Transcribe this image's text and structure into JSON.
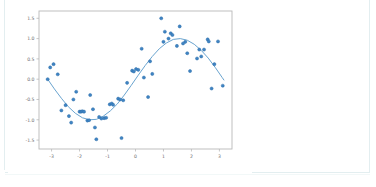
{
  "figure": {
    "name": "scatter-plot-with-fitted-sine-curve",
    "background_color": "#ffffff",
    "panel_border_color": "#e3eef0"
  },
  "chart_data": {
    "type": "scatter",
    "title": "",
    "subtitle": "",
    "xlabel": "",
    "ylabel": "",
    "xlim": [
      -3.45,
      3.45
    ],
    "ylim": [
      -1.72,
      1.68
    ],
    "xticks": [
      -3,
      -2,
      -1,
      0,
      1,
      2,
      3
    ],
    "xticklabels": [
      "-3",
      "-2",
      "-1",
      "0",
      "1",
      "2",
      "3"
    ],
    "yticks": [
      1.5,
      1.0,
      0.5,
      0.0,
      -0.5,
      -1.0,
      -1.5
    ],
    "yticklabels": [
      "1.5",
      "1.0",
      "0.5",
      "0.0",
      "-0.5",
      "-1.0",
      "-1.5"
    ],
    "grid": false,
    "legend": null,
    "legend_position": "none",
    "marker_color": "#3f84c4",
    "marker_edge_color": "#2f6ea8",
    "marker_size": 3.1,
    "line_color": "#6aa4cf",
    "line_width": 1.0,
    "axis_color": "#b9b9b9",
    "tick_label_color": "#6e6e6e",
    "tick_label_size": 4.6,
    "series": [
      {
        "name": "observations",
        "type": "scatter",
        "points": [
          [
            -3.14,
            0.0
          ],
          [
            -3.05,
            0.29
          ],
          [
            -2.93,
            0.37
          ],
          [
            -2.78,
            0.12
          ],
          [
            -2.65,
            -0.77
          ],
          [
            -2.5,
            -0.64
          ],
          [
            -2.38,
            -0.91
          ],
          [
            -2.3,
            -1.07
          ],
          [
            -2.22,
            -0.5
          ],
          [
            -2.12,
            -0.31
          ],
          [
            -2.0,
            -0.8
          ],
          [
            -1.95,
            -0.8
          ],
          [
            -1.9,
            -0.79
          ],
          [
            -1.84,
            -0.8
          ],
          [
            -1.72,
            -1.02
          ],
          [
            -1.66,
            -1.01
          ],
          [
            -1.62,
            -0.39
          ],
          [
            -1.52,
            -0.74
          ],
          [
            -1.45,
            -1.19
          ],
          [
            -1.4,
            -1.48
          ],
          [
            -1.3,
            -0.93
          ],
          [
            -1.22,
            -0.97
          ],
          [
            -1.12,
            -0.96
          ],
          [
            -1.05,
            -0.95
          ],
          [
            -0.92,
            -0.62
          ],
          [
            -0.85,
            -0.6
          ],
          [
            -0.8,
            -0.63
          ],
          [
            -0.62,
            -0.48
          ],
          [
            -0.55,
            -0.5
          ],
          [
            -0.5,
            -1.45
          ],
          [
            -0.44,
            -0.52
          ],
          [
            -0.3,
            -0.09
          ],
          [
            -0.12,
            0.21
          ],
          [
            -0.06,
            0.19
          ],
          [
            0.02,
            0.25
          ],
          [
            0.1,
            0.23
          ],
          [
            0.22,
            0.75
          ],
          [
            0.3,
            0.04
          ],
          [
            0.45,
            -0.44
          ],
          [
            0.52,
            0.44
          ],
          [
            0.6,
            0.13
          ],
          [
            0.92,
            1.5
          ],
          [
            1.0,
            0.92
          ],
          [
            1.05,
            1.17
          ],
          [
            1.18,
            1.0
          ],
          [
            1.26,
            1.13
          ],
          [
            1.32,
            1.09
          ],
          [
            1.48,
            0.82
          ],
          [
            1.58,
            1.3
          ],
          [
            1.7,
            0.88
          ],
          [
            1.78,
            0.92
          ],
          [
            1.85,
            0.64
          ],
          [
            1.95,
            0.2
          ],
          [
            2.2,
            0.51
          ],
          [
            2.28,
            0.73
          ],
          [
            2.35,
            0.56
          ],
          [
            2.45,
            0.73
          ],
          [
            2.58,
            0.98
          ],
          [
            2.62,
            0.93
          ],
          [
            2.72,
            -0.23
          ],
          [
            2.82,
            0.37
          ],
          [
            2.95,
            0.93
          ],
          [
            3.12,
            -0.16
          ]
        ]
      },
      {
        "name": "fitted-sine-curve",
        "type": "line",
        "function": "sin(x)",
        "x_range": [
          -3.14,
          3.14
        ],
        "points": [
          [
            -3.14,
            0.0
          ],
          [
            -2.9,
            -0.24
          ],
          [
            -2.65,
            -0.47
          ],
          [
            -2.4,
            -0.68
          ],
          [
            -2.15,
            -0.84
          ],
          [
            -1.9,
            -0.95
          ],
          [
            -1.65,
            -1.0
          ],
          [
            -1.4,
            -0.99
          ],
          [
            -1.15,
            -0.91
          ],
          [
            -0.9,
            -0.78
          ],
          [
            -0.65,
            -0.61
          ],
          [
            -0.4,
            -0.39
          ],
          [
            -0.15,
            -0.15
          ],
          [
            0.1,
            0.1
          ],
          [
            0.35,
            0.34
          ],
          [
            0.6,
            0.56
          ],
          [
            0.85,
            0.75
          ],
          [
            1.1,
            0.89
          ],
          [
            1.35,
            0.98
          ],
          [
            1.6,
            1.0
          ],
          [
            1.85,
            0.96
          ],
          [
            2.1,
            0.86
          ],
          [
            2.35,
            0.71
          ],
          [
            2.6,
            0.52
          ],
          [
            2.85,
            0.29
          ],
          [
            3.1,
            0.04
          ],
          [
            3.16,
            -0.02
          ]
        ]
      }
    ]
  }
}
